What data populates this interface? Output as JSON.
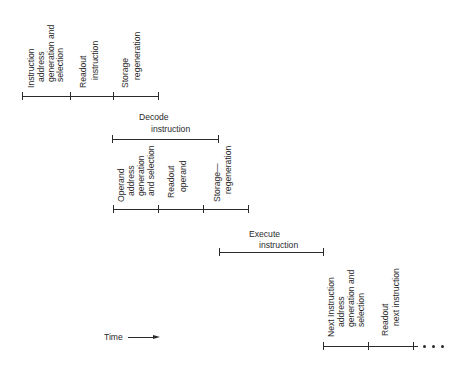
{
  "diagram": {
    "type": "instruction-timing-diagram",
    "stages": {
      "fetch": {
        "segments": [
          {
            "lines": [
              "Instruction",
              "address",
              "generation  and",
              "selection"
            ]
          },
          {
            "lines": [
              "Readout",
              "instruction"
            ]
          },
          {
            "lines": [
              "Storage",
              "regeneration"
            ]
          }
        ]
      },
      "decode": {
        "label_line1": "Decode",
        "label_line2": "instruction"
      },
      "operand": {
        "segments": [
          {
            "lines": [
              "Operand",
              "address",
              "generation",
              "and  selection"
            ]
          },
          {
            "lines": [
              "Readout",
              "operand"
            ]
          },
          {
            "lines": [
              "Storage—",
              "regeneration"
            ]
          }
        ]
      },
      "execute": {
        "label_line1": "Execute",
        "label_line2": "instruction"
      },
      "next": {
        "segments": [
          {
            "lines": [
              "Next  Instruction",
              "address",
              "generation  and",
              "selection"
            ]
          },
          {
            "lines": [
              "Readout",
              "next  instruction"
            ]
          }
        ],
        "continuation": "• • •"
      }
    },
    "time_axis": {
      "label": "Time",
      "direction": "right-arrow"
    },
    "line_color": "#2a2a2a",
    "background": "#ffffff"
  }
}
